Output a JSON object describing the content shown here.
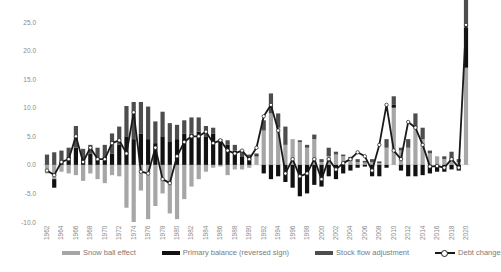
{
  "chart_data": {
    "type": "bar",
    "stacked": true,
    "title": "",
    "xlabel": "",
    "ylabel": "",
    "ylim": [
      -10,
      25
    ],
    "y_ticks": [
      "25.0",
      "20.0",
      "15.0",
      "10.0",
      "5.0",
      "0.0",
      "-5.0",
      "-10.0"
    ],
    "grid": false,
    "legend_position": "bottom",
    "x": [
      1962,
      1963,
      1964,
      1965,
      1966,
      1967,
      1968,
      1969,
      1970,
      1971,
      1972,
      1973,
      1974,
      1975,
      1976,
      1977,
      1978,
      1979,
      1980,
      1981,
      1982,
      1983,
      1984,
      1985,
      1986,
      1987,
      1988,
      1989,
      1990,
      1991,
      1992,
      1993,
      1994,
      1995,
      1996,
      1997,
      1998,
      1999,
      2000,
      2001,
      2002,
      2003,
      2004,
      2005,
      2006,
      2007,
      2008,
      2009,
      2010,
      2011,
      2012,
      2013,
      2014,
      2015,
      2016,
      2017,
      2018,
      2019,
      2020
    ],
    "x_tick_labels": [
      "1962",
      "1964",
      "1966",
      "1968",
      "1970",
      "1972",
      "1974",
      "1976",
      "1978",
      "1980",
      "1982",
      "1984",
      "1986",
      "1988",
      "1990",
      "1992",
      "1994",
      "1996",
      "1998",
      "2000",
      "2002",
      "2004",
      "2006",
      "2008",
      "2010",
      "2012",
      "2014",
      "2016",
      "2018",
      "2020"
    ],
    "series": [
      {
        "name": "Snow ball effect",
        "kind": "bar",
        "color": "#a6a6a6",
        "values": [
          -1.5,
          -2.5,
          -1.2,
          -1.5,
          -1.8,
          -2.8,
          -1.5,
          -2.5,
          -3.2,
          -1.8,
          -2.0,
          -7.5,
          -10.0,
          -4.5,
          -9.5,
          -7.2,
          -5.0,
          -8.5,
          -9.5,
          -6.0,
          -3.8,
          -2.5,
          -1.2,
          -0.5,
          -0.3,
          -1.8,
          -0.8,
          -0.8,
          -0.5,
          1.5,
          6.0,
          9.0,
          6.5,
          3.5,
          4.5,
          4.0,
          3.0,
          4.5,
          0.5,
          1.5,
          1.8,
          1.5,
          0.7,
          0.5,
          0.4,
          0.5,
          0.3,
          3.0,
          10.0,
          2.5,
          3.0,
          6.5,
          4.5,
          2.0,
          1.5,
          1.0,
          0.8,
          0.5,
          17.0
        ]
      },
      {
        "name": "Primary balance (reversed sign)",
        "kind": "bar",
        "color": "#111111",
        "values": [
          0.0,
          -1.5,
          0.5,
          1.5,
          3.0,
          1.0,
          2.0,
          1.0,
          1.5,
          2.0,
          3.5,
          5.0,
          4.5,
          5.5,
          4.5,
          3.8,
          5.0,
          4.0,
          4.5,
          5.5,
          5.5,
          5.8,
          5.0,
          5.5,
          4.0,
          3.5,
          2.5,
          1.5,
          1.0,
          0.2,
          -1.5,
          -2.5,
          -2.0,
          -3.0,
          -4.0,
          -5.5,
          -5.0,
          -3.5,
          -3.8,
          -2.0,
          -2.5,
          -1.5,
          -1.0,
          -0.5,
          -0.3,
          -2.0,
          -2.0,
          -0.5,
          0.5,
          -1.0,
          -2.0,
          -2.0,
          -1.8,
          -1.5,
          -1.2,
          -1.2,
          -0.8,
          -1.0,
          7.0
        ]
      },
      {
        "name": "Stock flow adjustment",
        "kind": "bar",
        "color": "#4d4d4d",
        "values": [
          1.8,
          2.2,
          2.0,
          1.5,
          3.8,
          1.8,
          1.5,
          2.0,
          2.0,
          3.5,
          3.2,
          5.3,
          6.5,
          5.5,
          5.7,
          3.8,
          4.3,
          3.3,
          2.5,
          2.3,
          2.8,
          2.5,
          1.8,
          1.0,
          0.5,
          0.8,
          1.0,
          1.0,
          0.8,
          0.3,
          1.8,
          3.5,
          2.5,
          3.2,
          0.0,
          0.3,
          0.5,
          0.8,
          0.5,
          1.5,
          0.5,
          0.3,
          0.7,
          0.5,
          0.3,
          0.5,
          0.3,
          1.5,
          1.5,
          0.5,
          1.5,
          2.5,
          2.0,
          0.5,
          0.0,
          0.5,
          1.5,
          0.5,
          7.0
        ]
      },
      {
        "name": "Debt change",
        "kind": "line",
        "color": "#1a1a1a",
        "marker": "circle-open",
        "values": [
          -1.0,
          -1.8,
          0.5,
          1.0,
          5.0,
          0.5,
          3.0,
          1.0,
          1.0,
          3.8,
          4.3,
          2.0,
          9.2,
          -1.2,
          -1.5,
          3.0,
          -2.5,
          -3.2,
          1.5,
          4.0,
          5.0,
          5.0,
          5.8,
          3.8,
          4.3,
          2.5,
          2.0,
          2.5,
          1.0,
          3.0,
          8.5,
          10.5,
          6.0,
          -1.5,
          1.0,
          -2.0,
          -1.5,
          1.0,
          -2.5,
          1.0,
          -0.8,
          0.3,
          1.0,
          2.2,
          1.5,
          -1.0,
          3.5,
          10.5,
          2.5,
          1.0,
          7.5,
          6.5,
          3.5,
          -0.3,
          -0.2,
          -0.5,
          1.0,
          -0.5,
          24.5
        ]
      }
    ]
  },
  "legend": {
    "items": [
      {
        "label": "Snow ball effect",
        "type": "bar",
        "color": "#a6a6a6"
      },
      {
        "label": "Primary balance (reversed sign)",
        "type": "bar",
        "color": "#111111"
      },
      {
        "label": "Stock flow adjustment",
        "type": "bar",
        "color": "#4d4d4d"
      },
      {
        "label": "Debt change",
        "type": "line-marker",
        "color": "#1a1a1a"
      }
    ]
  }
}
